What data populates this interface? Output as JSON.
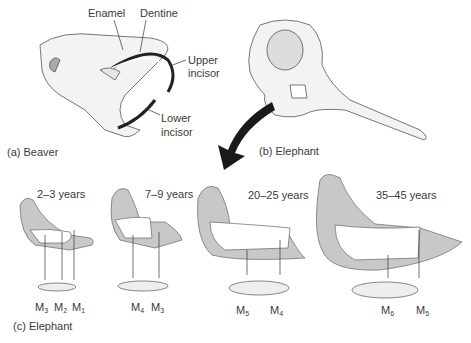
{
  "panels": {
    "a": {
      "caption": "(a) Beaver",
      "labels": {
        "enamel": "Enamel",
        "dentine": "Dentine",
        "upper_incisor_1": "Upper",
        "upper_incisor_2": "incisor",
        "lower_incisor_1": "Lower",
        "lower_incisor_2": "incisor"
      }
    },
    "b": {
      "caption": "(b) Elephant"
    },
    "c": {
      "caption": "(c) Elephant",
      "stages": [
        {
          "age": "2–3 years",
          "molars": [
            {
              "m": "M",
              "n": "3"
            },
            {
              "m": "M",
              "n": "2"
            },
            {
              "m": "M",
              "n": "1"
            }
          ]
        },
        {
          "age": "7–9 years",
          "molars": [
            {
              "m": "M",
              "n": "4"
            },
            {
              "m": "M",
              "n": "3"
            }
          ]
        },
        {
          "age": "20–25 years",
          "molars": [
            {
              "m": "M",
              "n": "5"
            },
            {
              "m": "M",
              "n": "4"
            }
          ]
        },
        {
          "age": "35–45 years",
          "molars": [
            {
              "m": "M",
              "n": "6"
            },
            {
              "m": "M",
              "n": "5"
            }
          ]
        }
      ]
    }
  },
  "colors": {
    "jaw_fill": "#c8c8c8",
    "line": "#333333",
    "arrow": "#1a1a1a",
    "bone": "#f2f2f0"
  }
}
